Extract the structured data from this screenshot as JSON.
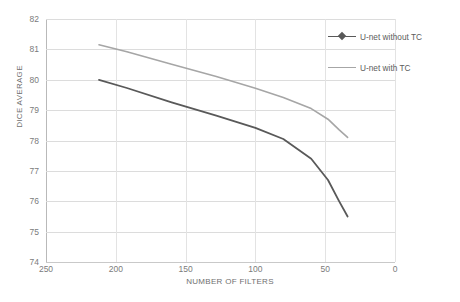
{
  "chart_data": {
    "type": "line",
    "title": "",
    "xlabel": "NUMBER OF FILTERS",
    "ylabel": "DICE AVERAGE",
    "xlim": [
      250,
      0
    ],
    "ylim": [
      74,
      82
    ],
    "x_reversed": true,
    "grid": true,
    "legend_position": "top-right",
    "x_ticks": [
      250,
      200,
      150,
      100,
      50,
      0
    ],
    "y_ticks": [
      74,
      75,
      76,
      77,
      78,
      79,
      80,
      81,
      82
    ],
    "x_tick_labels": [
      "250",
      "200",
      "150",
      "100",
      "50",
      "0"
    ],
    "y_tick_labels": [
      "74",
      "75",
      "76",
      "77",
      "78",
      "79",
      "80",
      "81",
      "82"
    ],
    "series": [
      {
        "name": "U-net without TC",
        "color": "#595959",
        "x": [
          212,
          192,
          160,
          128,
          100,
          80,
          60,
          48,
          40,
          34
        ],
        "values": [
          80.0,
          79.73,
          79.26,
          78.82,
          78.42,
          78.05,
          77.4,
          76.7,
          76.0,
          75.5
        ]
      },
      {
        "name": "U-net with TC",
        "color": "#a6a6a6",
        "x": [
          212,
          192,
          160,
          128,
          100,
          80,
          60,
          48,
          40,
          34
        ],
        "values": [
          81.15,
          80.92,
          80.51,
          80.11,
          79.72,
          79.42,
          79.05,
          78.7,
          78.35,
          78.1
        ]
      }
    ]
  },
  "legend": {
    "items": [
      {
        "label": "U-net without TC",
        "color": "#595959",
        "marker": "diamond"
      },
      {
        "label": "U-net with TC",
        "color": "#a6a6a6",
        "marker": "none"
      }
    ]
  },
  "colors": {
    "series_dark": "#595959",
    "series_light": "#a6a6a6",
    "gridline": "#dcdcdc",
    "axis": "#b9b9b9",
    "tick_text": "#7b7b7b",
    "background": "#ffffff"
  }
}
